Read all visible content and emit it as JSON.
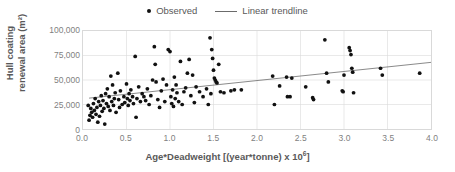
{
  "legend": {
    "position": "top-center",
    "entries": [
      {
        "label": "Observed",
        "marker": "dot",
        "color": "#111111"
      },
      {
        "label": "Linear trendline",
        "marker": "line",
        "color": "#6b6b6b"
      }
    ]
  },
  "axes": {
    "y_title_line1": "Hull coating",
    "y_title_line2": "renewal area (m²)",
    "x_title_main": "Age*Deadweight [(year*tonne) x 10",
    "x_title_exp": "6",
    "x_title_tail": "]",
    "y_ticks": [
      "0",
      "25,000",
      "50,000",
      "75,000",
      "100,000"
    ],
    "x_ticks": [
      "0.0",
      "0.5",
      "1.0",
      "1.5",
      "2.0",
      "2.5",
      "3.0",
      "3.5",
      "4.0"
    ]
  },
  "colors": {
    "marker": "#111111",
    "trendline": "#6b6b6b",
    "gridline": "#d9d9d9",
    "frame": "#d9d9d9",
    "tick_text": "#7f7f7f",
    "title_text": "#595959",
    "background": "#ffffff"
  },
  "chart_data": {
    "type": "scatter",
    "title": "",
    "subtitle": "",
    "xlabel": "Age*Deadweight [(year*tonne) x 10^6]",
    "ylabel": "Hull coating renewal area (m²)",
    "xlim": [
      0.0,
      4.0
    ],
    "ylim": [
      0,
      100000
    ],
    "xticks": [
      0.0,
      0.5,
      1.0,
      1.5,
      2.0,
      2.5,
      3.0,
      3.5,
      4.0
    ],
    "yticks": [
      0,
      25000,
      50000,
      75000,
      100000
    ],
    "grid": true,
    "legend_position": "top-center",
    "series": [
      {
        "name": "Observed",
        "type": "scatter",
        "marker": "circle",
        "color": "#111111",
        "points": [
          [
            0.06,
            24000
          ],
          [
            0.07,
            9000
          ],
          [
            0.08,
            14000
          ],
          [
            0.09,
            21000
          ],
          [
            0.1,
            17000
          ],
          [
            0.11,
            12000
          ],
          [
            0.12,
            26000
          ],
          [
            0.13,
            19000
          ],
          [
            0.14,
            31000
          ],
          [
            0.15,
            15000
          ],
          [
            0.16,
            22000
          ],
          [
            0.17,
            7000
          ],
          [
            0.18,
            28000
          ],
          [
            0.19,
            13000
          ],
          [
            0.2,
            24000
          ],
          [
            0.21,
            34000
          ],
          [
            0.22,
            18000
          ],
          [
            0.23,
            29000
          ],
          [
            0.24,
            21000
          ],
          [
            0.25,
            5000
          ],
          [
            0.26,
            36000
          ],
          [
            0.27,
            26000
          ],
          [
            0.28,
            41000
          ],
          [
            0.29,
            23000
          ],
          [
            0.3,
            33000
          ],
          [
            0.31,
            19000
          ],
          [
            0.32,
            54000
          ],
          [
            0.33,
            28000
          ],
          [
            0.34,
            45000
          ],
          [
            0.35,
            24000
          ],
          [
            0.36,
            31000
          ],
          [
            0.37,
            37000
          ],
          [
            0.38,
            17000
          ],
          [
            0.4,
            57000
          ],
          [
            0.41,
            30000
          ],
          [
            0.42,
            22000
          ],
          [
            0.43,
            39000
          ],
          [
            0.45,
            25000
          ],
          [
            0.47,
            33000
          ],
          [
            0.48,
            27000
          ],
          [
            0.5,
            46000
          ],
          [
            0.51,
            31000
          ],
          [
            0.52,
            24000
          ],
          [
            0.53,
            36000
          ],
          [
            0.54,
            29000
          ],
          [
            0.55,
            40000
          ],
          [
            0.57,
            33000
          ],
          [
            0.58,
            26000
          ],
          [
            0.6,
            74000
          ],
          [
            0.61,
            12000
          ],
          [
            0.62,
            31000
          ],
          [
            0.64,
            43000
          ],
          [
            0.66,
            28000
          ],
          [
            0.68,
            36000
          ],
          [
            0.7,
            33000
          ],
          [
            0.72,
            29000
          ],
          [
            0.74,
            41000
          ],
          [
            0.76,
            25000
          ],
          [
            0.78,
            34000
          ],
          [
            0.8,
            50000
          ],
          [
            0.82,
            84000
          ],
          [
            0.83,
            66000
          ],
          [
            0.84,
            48000
          ],
          [
            0.86,
            30000
          ],
          [
            0.88,
            22000
          ],
          [
            0.9,
            39000
          ],
          [
            0.92,
            51000
          ],
          [
            0.94,
            28000
          ],
          [
            0.96,
            45000
          ],
          [
            0.98,
            81000
          ],
          [
            1.0,
            79000
          ],
          [
            1.01,
            33000
          ],
          [
            1.02,
            26000
          ],
          [
            1.03,
            40000
          ],
          [
            1.04,
            23000
          ],
          [
            1.05,
            53000
          ],
          [
            1.06,
            31000
          ],
          [
            1.07,
            45000
          ],
          [
            1.08,
            37000
          ],
          [
            1.1,
            28000
          ],
          [
            1.12,
            69000
          ],
          [
            1.14,
            25000
          ],
          [
            1.16,
            38000
          ],
          [
            1.18,
            42000
          ],
          [
            1.2,
            57000
          ],
          [
            1.22,
            71000
          ],
          [
            1.24,
            34000
          ],
          [
            1.26,
            55000
          ],
          [
            1.28,
            27000
          ],
          [
            1.3,
            43000
          ],
          [
            1.34,
            38000
          ],
          [
            1.38,
            33000
          ],
          [
            1.42,
            41000
          ],
          [
            1.44,
            25000
          ],
          [
            1.46,
            93000
          ],
          [
            1.47,
            36000
          ],
          [
            1.48,
            81000
          ],
          [
            1.49,
            72000
          ],
          [
            1.5,
            60000
          ],
          [
            1.51,
            52000
          ],
          [
            1.52,
            50000
          ],
          [
            1.53,
            48000
          ],
          [
            1.54,
            47000
          ],
          [
            1.56,
            66000
          ],
          [
            1.58,
            38000
          ],
          [
            1.62,
            37000
          ],
          [
            1.7,
            39000
          ],
          [
            1.74,
            40000
          ],
          [
            1.82,
            40000
          ],
          [
            2.18,
            54000
          ],
          [
            2.2,
            25000
          ],
          [
            2.26,
            44000
          ],
          [
            2.34,
            53000
          ],
          [
            2.35,
            33000
          ],
          [
            2.38,
            33000
          ],
          [
            2.4,
            52000
          ],
          [
            2.56,
            43000
          ],
          [
            2.64,
            32000
          ],
          [
            2.65,
            30000
          ],
          [
            2.78,
            91000
          ],
          [
            2.8,
            57000
          ],
          [
            2.82,
            48000
          ],
          [
            2.98,
            39000
          ],
          [
            2.99,
            38000
          ],
          [
            3.0,
            55000
          ],
          [
            3.06,
            83000
          ],
          [
            3.07,
            80000
          ],
          [
            3.08,
            76000
          ],
          [
            3.09,
            62000
          ],
          [
            3.1,
            58000
          ],
          [
            3.11,
            37000
          ],
          [
            3.42,
            62000
          ],
          [
            3.44,
            55000
          ],
          [
            3.87,
            57000
          ]
        ]
      },
      {
        "name": "Linear trendline",
        "type": "line",
        "color": "#6b6b6b",
        "x_start": 0.07,
        "y_start": 31500,
        "x_end": 4.0,
        "y_end": 68000
      }
    ]
  }
}
